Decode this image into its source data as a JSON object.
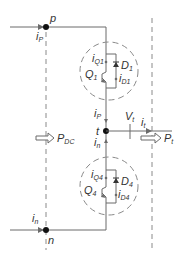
{
  "diagram": {
    "colors": {
      "wire": "#6b6b6b",
      "node": "#111111",
      "dashed": "#8a8a8a",
      "text": "#333333"
    },
    "nodes": [
      {
        "id": "p",
        "label": "p"
      },
      {
        "id": "t",
        "label": "t"
      },
      {
        "id": "n",
        "label": "n"
      }
    ],
    "currents": {
      "ip_top": {
        "main": "i",
        "sub": "P"
      },
      "in_bottom": {
        "main": "i",
        "sub": "n"
      },
      "ip_mid": {
        "main": "i",
        "sub": "P"
      },
      "in_mid": {
        "main": "i",
        "sub": "n"
      },
      "it": {
        "main": "i",
        "sub": "t"
      },
      "iQ1": {
        "main": "i",
        "sub": "Q1"
      },
      "iD1": {
        "main": "i",
        "sub": "D1"
      },
      "iQ4": {
        "main": "i",
        "sub": "Q4"
      },
      "iD4": {
        "main": "i",
        "sub": "D4"
      }
    },
    "devices": {
      "Q1": {
        "main": "Q",
        "sub": "1"
      },
      "D1": {
        "main": "D",
        "sub": "1"
      },
      "Q4": {
        "main": "Q",
        "sub": "4"
      },
      "D4": {
        "main": "D",
        "sub": "4"
      }
    },
    "voltage": {
      "main": "V",
      "sub": "t"
    },
    "power": {
      "dc": {
        "main": "P",
        "sub": "DC"
      },
      "t": {
        "main": "P",
        "sub": "t"
      }
    }
  }
}
